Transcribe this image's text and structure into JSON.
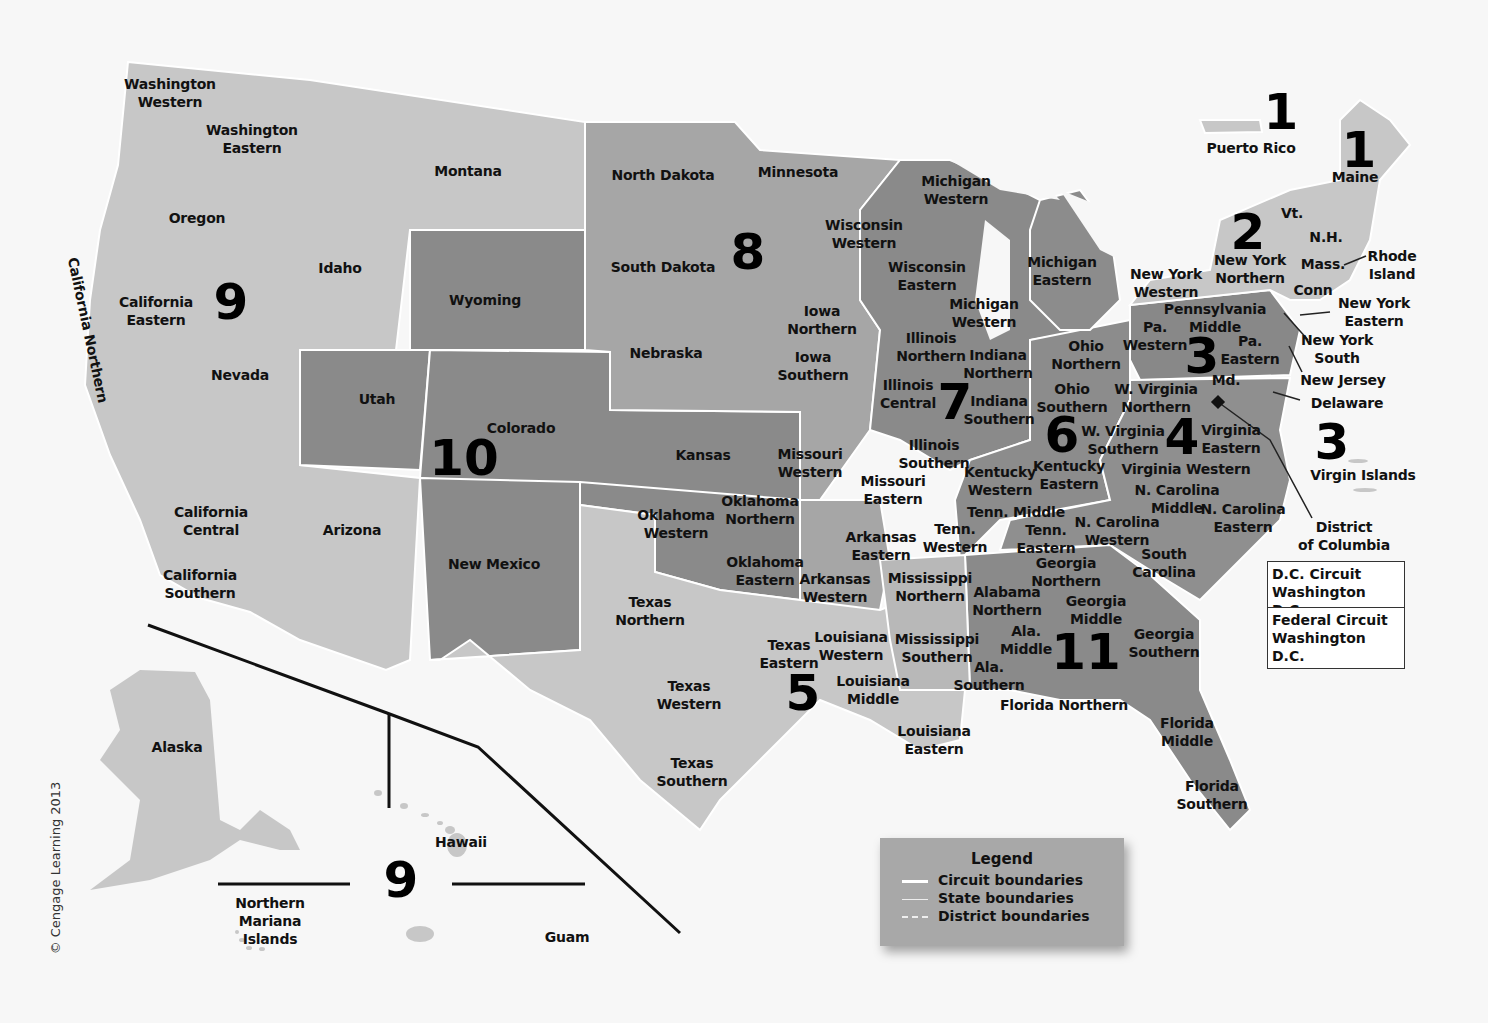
{
  "map": {
    "title": "U.S. Federal Judicial Circuits and Districts",
    "colors": {
      "light": "#c7c7c7",
      "medium": "#a6a6a6",
      "dark": "#8a8a8a",
      "background": "#f7f7f7",
      "boundary": "#ffffff"
    },
    "copyright": "© Cengage Learning 2013",
    "circuits": [
      {
        "number": "1",
        "x": 1281,
        "y": 112
      },
      {
        "number": "1",
        "x": 1359,
        "y": 150
      },
      {
        "number": "2",
        "x": 1248,
        "y": 232
      },
      {
        "number": "3",
        "x": 1202,
        "y": 356
      },
      {
        "number": "3",
        "x": 1332,
        "y": 442
      },
      {
        "number": "4",
        "x": 1182,
        "y": 437
      },
      {
        "number": "5",
        "x": 803,
        "y": 693
      },
      {
        "number": "6",
        "x": 1062,
        "y": 435
      },
      {
        "number": "7",
        "x": 955,
        "y": 402
      },
      {
        "number": "8",
        "x": 748,
        "y": 252
      },
      {
        "number": "9",
        "x": 231,
        "y": 302
      },
      {
        "number": "9",
        "x": 401,
        "y": 880
      },
      {
        "number": "10",
        "x": 464,
        "y": 458
      },
      {
        "number": "11",
        "x": 1086,
        "y": 652
      }
    ],
    "labels": [
      {
        "text": "Washington\nWestern",
        "x": 170,
        "y": 93
      },
      {
        "text": "Washington\nEastern",
        "x": 252,
        "y": 139
      },
      {
        "text": "Montana",
        "x": 468,
        "y": 171
      },
      {
        "text": "North Dakota",
        "x": 663,
        "y": 175
      },
      {
        "text": "Minnesota",
        "x": 798,
        "y": 172
      },
      {
        "text": "Oregon",
        "x": 197,
        "y": 218
      },
      {
        "text": "Idaho",
        "x": 340,
        "y": 268
      },
      {
        "text": "California\nEastern",
        "x": 156,
        "y": 311
      },
      {
        "text": "Wyoming",
        "x": 485,
        "y": 300
      },
      {
        "text": "South Dakota",
        "x": 663,
        "y": 267
      },
      {
        "text": "Nevada",
        "x": 240,
        "y": 375
      },
      {
        "text": "Nebraska",
        "x": 666,
        "y": 353
      },
      {
        "text": "Utah",
        "x": 377,
        "y": 399
      },
      {
        "text": "Colorado",
        "x": 521,
        "y": 428
      },
      {
        "text": "Kansas",
        "x": 703,
        "y": 455
      },
      {
        "text": "California\nCentral",
        "x": 211,
        "y": 521
      },
      {
        "text": "Arizona",
        "x": 352,
        "y": 530
      },
      {
        "text": "New Mexico",
        "x": 494,
        "y": 564
      },
      {
        "text": "California\nSouthern",
        "x": 200,
        "y": 584
      },
      {
        "text": "Wisconsin\nWestern",
        "x": 864,
        "y": 234
      },
      {
        "text": "Wisconsin\nEastern",
        "x": 927,
        "y": 276
      },
      {
        "text": "Michigan\nWestern",
        "x": 956,
        "y": 190
      },
      {
        "text": "Michigan\nEastern",
        "x": 1062,
        "y": 271
      },
      {
        "text": "Michigan\nWestern",
        "x": 984,
        "y": 313
      },
      {
        "text": "Iowa\nNorthern",
        "x": 822,
        "y": 320
      },
      {
        "text": "Iowa\nSouthern",
        "x": 813,
        "y": 366
      },
      {
        "text": "Illinois\nNorthern",
        "x": 931,
        "y": 347
      },
      {
        "text": "Illinois\nCentral",
        "x": 908,
        "y": 394
      },
      {
        "text": "Illinois\nSouthern",
        "x": 934,
        "y": 454
      },
      {
        "text": "Indiana\nNorthern",
        "x": 998,
        "y": 364
      },
      {
        "text": "Indiana\nSouthern",
        "x": 999,
        "y": 410
      },
      {
        "text": "Ohio\nNorthern",
        "x": 1086,
        "y": 355
      },
      {
        "text": "Ohio\nSouthern",
        "x": 1072,
        "y": 398
      },
      {
        "text": "Missouri\nWestern",
        "x": 810,
        "y": 463
      },
      {
        "text": "Missouri\nEastern",
        "x": 893,
        "y": 490
      },
      {
        "text": "Oklahoma\nNorthern",
        "x": 760,
        "y": 510
      },
      {
        "text": "Oklahoma\nWestern",
        "x": 676,
        "y": 524
      },
      {
        "text": "Oklahoma\nEastern",
        "x": 765,
        "y": 571
      },
      {
        "text": "Arkansas\nEastern",
        "x": 881,
        "y": 546
      },
      {
        "text": "Arkansas\nWestern",
        "x": 835,
        "y": 588
      },
      {
        "text": "Texas\nNorthern",
        "x": 650,
        "y": 611
      },
      {
        "text": "Texas\nEastern",
        "x": 789,
        "y": 654
      },
      {
        "text": "Texas\nWestern",
        "x": 689,
        "y": 695
      },
      {
        "text": "Texas\nSouthern",
        "x": 692,
        "y": 772
      },
      {
        "text": "Louisiana\nWestern",
        "x": 851,
        "y": 646
      },
      {
        "text": "Louisiana\nMiddle",
        "x": 873,
        "y": 690
      },
      {
        "text": "Louisiana\nEastern",
        "x": 934,
        "y": 740
      },
      {
        "text": "Mississippi\nNorthern",
        "x": 930,
        "y": 587
      },
      {
        "text": "Mississippi\nSouthern",
        "x": 937,
        "y": 648
      },
      {
        "text": "Kentucky\nWestern",
        "x": 1000,
        "y": 481
      },
      {
        "text": "Kentucky\nEastern",
        "x": 1069,
        "y": 475
      },
      {
        "text": "Tenn. Middle",
        "x": 1016,
        "y": 512
      },
      {
        "text": "Tenn.\nWestern",
        "x": 955,
        "y": 538
      },
      {
        "text": "Tenn.\nEastern",
        "x": 1046,
        "y": 539
      },
      {
        "text": "W. Virginia\nNorthern",
        "x": 1156,
        "y": 398
      },
      {
        "text": "W. Virginia\nSouthern",
        "x": 1123,
        "y": 440
      },
      {
        "text": "Virginia\nEastern",
        "x": 1231,
        "y": 439
      },
      {
        "text": "Virginia Western",
        "x": 1186,
        "y": 469
      },
      {
        "text": "N. Carolina\nMiddle",
        "x": 1177,
        "y": 499
      },
      {
        "text": "N. Carolina\nEastern",
        "x": 1243,
        "y": 518
      },
      {
        "text": "N. Carolina\nWestern",
        "x": 1117,
        "y": 531
      },
      {
        "text": "South\nCarolina",
        "x": 1164,
        "y": 563
      },
      {
        "text": "Georgia\nNorthern",
        "x": 1066,
        "y": 572
      },
      {
        "text": "Georgia\nMiddle",
        "x": 1096,
        "y": 610
      },
      {
        "text": "Georgia\nSouthern",
        "x": 1164,
        "y": 643
      },
      {
        "text": "Alabama\nNorthern",
        "x": 1007,
        "y": 601
      },
      {
        "text": "Ala.\nMiddle",
        "x": 1026,
        "y": 640
      },
      {
        "text": "Ala.\nSouthern",
        "x": 989,
        "y": 676
      },
      {
        "text": "Florida Northern",
        "x": 1064,
        "y": 705
      },
      {
        "text": "Florida\nMiddle",
        "x": 1187,
        "y": 732
      },
      {
        "text": "Florida\nSouthern",
        "x": 1212,
        "y": 795
      },
      {
        "text": "Pennsylvania\nMiddle",
        "x": 1215,
        "y": 318
      },
      {
        "text": "Pa.\nWestern",
        "x": 1155,
        "y": 336
      },
      {
        "text": "Pa.\nEastern",
        "x": 1250,
        "y": 350
      },
      {
        "text": "Md.",
        "x": 1226,
        "y": 380
      },
      {
        "text": "New York\nWestern",
        "x": 1166,
        "y": 283
      },
      {
        "text": "New York\nNorthern",
        "x": 1250,
        "y": 269
      },
      {
        "text": "Vt.",
        "x": 1292,
        "y": 213
      },
      {
        "text": "N.H.",
        "x": 1326,
        "y": 237
      },
      {
        "text": "Mass.",
        "x": 1323,
        "y": 264
      },
      {
        "text": "Conn",
        "x": 1313,
        "y": 290
      },
      {
        "text": "Rhode\nIsland",
        "x": 1392,
        "y": 265
      },
      {
        "text": "New York\nEastern",
        "x": 1374,
        "y": 312
      },
      {
        "text": "New York\nSouth",
        "x": 1337,
        "y": 349
      },
      {
        "text": "New Jersey",
        "x": 1343,
        "y": 380
      },
      {
        "text": "Delaware",
        "x": 1347,
        "y": 403
      },
      {
        "text": "Maine",
        "x": 1355,
        "y": 177
      },
      {
        "text": "Puerto Rico",
        "x": 1251,
        "y": 148
      },
      {
        "text": "Virgin Islands",
        "x": 1363,
        "y": 475
      },
      {
        "text": "District\nof Columbia",
        "x": 1344,
        "y": 536
      },
      {
        "text": "Alaska",
        "x": 177,
        "y": 747
      },
      {
        "text": "Hawaii",
        "x": 461,
        "y": 842
      },
      {
        "text": "Northern\nMariana\nIslands",
        "x": 270,
        "y": 921
      },
      {
        "text": "Guam",
        "x": 567,
        "y": 937
      }
    ],
    "rotated_label": {
      "text": "California Northern",
      "x": 88,
      "y": 330
    },
    "dc_box": [
      {
        "line1": "D.C. Circuit",
        "line2": "Washington D.C."
      },
      {
        "line1": "Federal Circuit",
        "line2": "Washington D.C."
      }
    ],
    "legend": {
      "title": "Legend",
      "items": [
        {
          "label": "Circuit boundaries",
          "style": "solid-thick"
        },
        {
          "label": "State boundaries",
          "style": "solid-thin"
        },
        {
          "label": "District boundaries",
          "style": "dashed"
        }
      ]
    }
  }
}
